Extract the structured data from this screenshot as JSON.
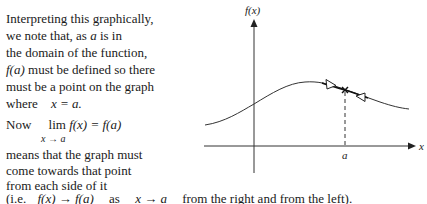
{
  "text": {
    "line1": "Interpreting this graphically,",
    "line2_a": "we note that, as",
    "line2_var": "a",
    "line2_b": "is in",
    "line3": "the domain of the function,",
    "line4_fa": "f(a)",
    "line4_b": "must be defined so there",
    "line5": "must be a point on the graph",
    "line6_a": "where",
    "line6_eq": "x = a.",
    "line7_now": "Now",
    "line7_lim": "lim",
    "line7_expr": "f(x) = f(a)",
    "line7_sub": "x → a",
    "line8": "means that the graph must",
    "line9": "come towards that point",
    "line10": "from each side of it",
    "line11_a": "(i.e.",
    "line11_expr1": "f(x) → f(a)",
    "line11_as": "as",
    "line11_expr2": "x → a",
    "line11_b": "from the right and from the left)."
  },
  "graph": {
    "y_axis_label": "f(x)",
    "x_axis_label": "x",
    "point_label": "a",
    "axis_color": "#333333",
    "curve_color": "#333333"
  }
}
